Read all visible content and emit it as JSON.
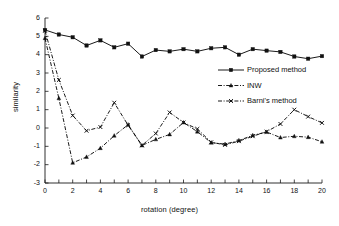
{
  "chart_data": {
    "type": "line",
    "title": "",
    "xlabel": "rotation (degree)",
    "ylabel": "similarity",
    "xlim": [
      0,
      20
    ],
    "ylim": [
      -3,
      6
    ],
    "xticks": [
      0,
      1,
      2,
      3,
      4,
      5,
      6,
      7,
      8,
      9,
      10,
      11,
      12,
      13,
      14,
      15,
      16,
      17,
      18,
      19,
      20
    ],
    "xtick_labels": [
      "0",
      "2",
      "4",
      "6",
      "8",
      "10",
      "12",
      "14",
      "16",
      "18",
      "20"
    ],
    "xtick_label_values": [
      0,
      2,
      4,
      6,
      8,
      10,
      12,
      14,
      16,
      18,
      20
    ],
    "yticks": [
      -3,
      -2,
      -1,
      0,
      1,
      2,
      3,
      4,
      5,
      6
    ],
    "ytick_labels": [
      "-3",
      "-2",
      "-1",
      "0",
      "1",
      "2",
      "3",
      "4",
      "5",
      "6"
    ],
    "grid": false,
    "legend_position": "upper right",
    "x": [
      0,
      1,
      2,
      3,
      4,
      5,
      6,
      7,
      8,
      9,
      10,
      11,
      12,
      13,
      14,
      15,
      16,
      17,
      18,
      19,
      20
    ],
    "series": [
      {
        "name": "Proposed method",
        "linestyle": "solid",
        "marker": "square",
        "color": "#000000",
        "values": [
          5.35,
          5.1,
          4.95,
          4.5,
          4.78,
          4.4,
          4.6,
          3.9,
          4.25,
          4.18,
          4.3,
          4.18,
          4.35,
          4.4,
          4.0,
          4.3,
          4.22,
          4.15,
          3.9,
          3.78,
          3.92
        ]
      },
      {
        "name": "INW",
        "linestyle": "dashdot",
        "marker": "triangle",
        "color": "#000000",
        "values": [
          4.9,
          1.62,
          -1.9,
          -1.58,
          -1.1,
          -0.42,
          0.18,
          -0.95,
          -0.62,
          -0.35,
          0.3,
          -0.2,
          -0.8,
          -0.88,
          -0.68,
          -0.4,
          -0.22,
          -0.52,
          -0.45,
          -0.5,
          -0.75
        ]
      },
      {
        "name": "Barni's method",
        "linestyle": "dashdot",
        "marker": "x",
        "color": "#000000",
        "values": [
          5.3,
          2.62,
          0.68,
          -0.15,
          0.05,
          1.38,
          0.15,
          -0.95,
          -0.3,
          0.85,
          0.3,
          -0.05,
          -0.78,
          -0.92,
          -0.72,
          -0.45,
          -0.2,
          0.22,
          1.0,
          0.62,
          0.28
        ]
      }
    ]
  },
  "legend": {
    "entries": [
      {
        "label": "Proposed method"
      },
      {
        "label": "INW"
      },
      {
        "label": "Barni's method"
      }
    ]
  }
}
